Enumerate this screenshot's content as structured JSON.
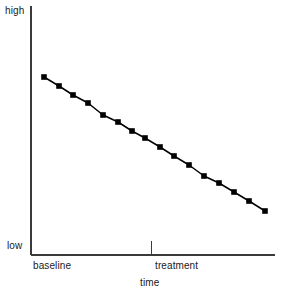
{
  "chart_data": {
    "type": "line",
    "title": "",
    "subtitle": "",
    "xlabel": "time",
    "ylabel": "",
    "grid": false,
    "legend": null,
    "annotations": [],
    "series": [
      {
        "name": "outcome",
        "marker": "filled-square",
        "color": "#000000",
        "x": [
          0,
          1,
          2,
          3,
          4,
          5,
          6,
          7,
          8,
          9,
          10,
          11,
          12,
          13,
          14,
          15
        ],
        "y": [
          15,
          14,
          13,
          12,
          11,
          10,
          9,
          8,
          7,
          6,
          5,
          4,
          3,
          2,
          1,
          0
        ],
        "points_px": [
          [
            44,
            77
          ],
          [
            59,
            86
          ],
          [
            73,
            95
          ],
          [
            88,
            103
          ],
          [
            103,
            115
          ],
          [
            118,
            122
          ],
          [
            132,
            131
          ],
          [
            145,
            138
          ],
          [
            160,
            147
          ],
          [
            174,
            156
          ],
          [
            189,
            165
          ],
          [
            204,
            176
          ],
          [
            219,
            183
          ],
          [
            234,
            192
          ],
          [
            249,
            201
          ],
          [
            265,
            211
          ]
        ]
      }
    ],
    "x_axis": {
      "range_labels": [
        "baseline",
        "treatment"
      ],
      "tick_positions_px": [
        151
      ],
      "tick_labels": [
        "treatment"
      ],
      "line_px": {
        "x1": 31,
        "y1": 255,
        "x2": 275,
        "y2": 255
      }
    },
    "y_axis": {
      "range_labels": [
        "low",
        "high"
      ],
      "tick_labels": [],
      "line_px": {
        "x1": 31,
        "y1": 6,
        "x2": 31,
        "y2": 255
      }
    }
  },
  "labels": {
    "y_high": "high",
    "y_low": "low",
    "x_baseline": "baseline",
    "x_treatment": "treatment",
    "x_axis_title": "time"
  },
  "colors": {
    "background": "#ffffff",
    "axis": "#3a3a3a",
    "line": "#111111",
    "marker": "#000000",
    "text": "#1a1a1a"
  }
}
